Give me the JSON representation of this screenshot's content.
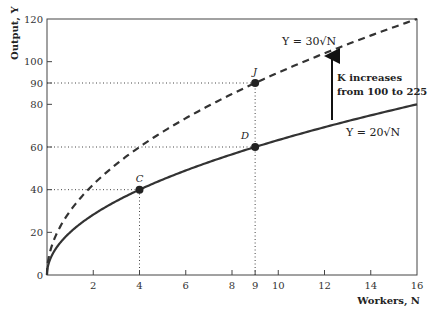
{
  "chart_data": {
    "type": "line",
    "title": "",
    "xlabel": "Workers, N",
    "ylabel": "Output, Y",
    "xlim": [
      0,
      16
    ],
    "ylim": [
      0,
      120
    ],
    "x_ticks": [
      2,
      4,
      6,
      8,
      9,
      10,
      12,
      14,
      16
    ],
    "y_ticks": [
      0,
      20,
      40,
      60,
      80,
      90,
      100,
      120
    ],
    "grid": false,
    "series": [
      {
        "name": "Y = 30√N",
        "style": "dashed",
        "function": "30*sqrt(N)",
        "x": [
          0,
          1,
          2,
          4,
          6,
          8,
          9,
          10,
          12,
          14,
          16
        ],
        "values": [
          0,
          30,
          42.4,
          60,
          73.5,
          84.9,
          90,
          94.9,
          103.9,
          112.2,
          120
        ]
      },
      {
        "name": "Y = 20√N",
        "style": "solid",
        "function": "20*sqrt(N)",
        "x": [
          0,
          1,
          2,
          4,
          6,
          8,
          9,
          10,
          12,
          14,
          16
        ],
        "values": [
          0,
          20,
          28.3,
          40,
          49,
          56.6,
          60,
          63.2,
          69.3,
          74.8,
          80
        ]
      }
    ],
    "points": [
      {
        "label": "C",
        "x": 4,
        "y": 40
      },
      {
        "label": "D",
        "x": 9,
        "y": 60
      },
      {
        "label": "J",
        "x": 9,
        "y": 90
      }
    ],
    "reference_lines": [
      {
        "type": "horizontal",
        "y": 40,
        "to_x": 4
      },
      {
        "type": "horizontal",
        "y": 60,
        "to_x": 9
      },
      {
        "type": "horizontal",
        "y": 90,
        "to_x": 9
      },
      {
        "type": "vertical",
        "x": 4,
        "to_y": 40
      },
      {
        "type": "vertical",
        "x": 9,
        "to_y": 90
      }
    ],
    "annotations": [
      {
        "text": "K increases",
        "line": 1
      },
      {
        "text": "from 100 to 225",
        "line": 2
      }
    ]
  },
  "labels": {
    "ylabel": "Output, Y",
    "xlabel": "Workers, N",
    "upper_curve": "Y = 30√N",
    "lower_curve": "Y = 20√N",
    "anno_line1": "K increases",
    "anno_line2": "from 100 to 225",
    "point_c": "C",
    "point_d": "D",
    "point_j": "J"
  },
  "x_tick_labels": [
    "2",
    "4",
    "6",
    "8",
    "9",
    "10",
    "12",
    "14",
    "16"
  ],
  "y_tick_labels": [
    "0",
    "20",
    "40",
    "60",
    "80",
    "90",
    "100",
    "120"
  ]
}
